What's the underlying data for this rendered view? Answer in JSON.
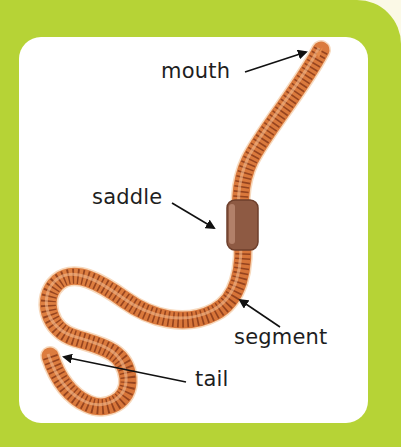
{
  "diagram": {
    "colors": {
      "background_green": "#b6d336",
      "panel": "#ffffff",
      "worm_body": "#d9773a",
      "worm_stripe": "#8a3b1a",
      "saddle": "#8e5a43",
      "label_text": "#1e1e1e"
    },
    "labels": [
      {
        "id": "mouth",
        "text": "mouth"
      },
      {
        "id": "saddle",
        "text": "saddle"
      },
      {
        "id": "segment",
        "text": "segment"
      },
      {
        "id": "tail",
        "text": "tail"
      }
    ]
  }
}
